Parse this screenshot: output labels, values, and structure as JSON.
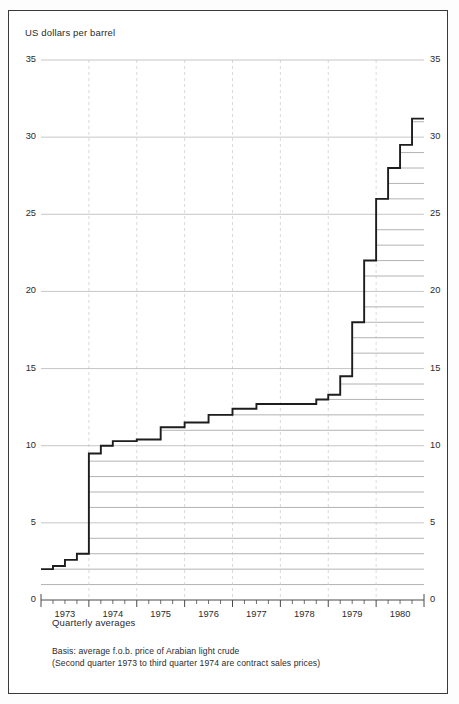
{
  "figure": {
    "axis_title": "US dollars per barrel",
    "sub_label": "Quarterly averages",
    "footnote_line1": "Basis: average f.o.b. price of Arabian light crude",
    "footnote_line2": "(Second quarter 1973 to third quarter 1974 are contract sales prices)"
  },
  "chart_data": {
    "type": "line",
    "subtype": "step",
    "title": "US dollars per barrel",
    "xlabel": "Quarterly averages",
    "ylabel": "US dollars per barrel",
    "ylim": [
      0,
      35
    ],
    "ytick_labels": [
      "0",
      "5",
      "10",
      "15",
      "20",
      "25",
      "30",
      "35"
    ],
    "ytick_values": [
      0,
      5,
      10,
      15,
      20,
      25,
      30,
      35
    ],
    "yticks_both_sides": true,
    "minor_gridline_step": 1,
    "grid": true,
    "legend": "none",
    "xtick_labels": [
      "1973",
      "1974",
      "1975",
      "1976",
      "1977",
      "1978",
      "1979",
      "1980"
    ],
    "xtick_values": [
      1973,
      1974,
      1975,
      1976,
      1977,
      1978,
      1979,
      1980
    ],
    "x_minor_ticks": "quarterly",
    "categories": [
      "1973 Q1",
      "1973 Q2",
      "1973 Q3",
      "1973 Q4",
      "1974 Q1",
      "1974 Q2",
      "1974 Q3",
      "1974 Q4",
      "1975 Q1",
      "1975 Q2",
      "1975 Q3",
      "1975 Q4",
      "1976 Q1",
      "1976 Q2",
      "1976 Q3",
      "1976 Q4",
      "1977 Q1",
      "1977 Q2",
      "1977 Q3",
      "1977 Q4",
      "1978 Q1",
      "1978 Q2",
      "1978 Q3",
      "1978 Q4",
      "1979 Q1",
      "1979 Q2",
      "1979 Q3",
      "1979 Q4",
      "1980 Q1",
      "1980 Q2",
      "1980 Q3",
      "1980 Q4"
    ],
    "values": [
      2.0,
      2.2,
      2.6,
      3.0,
      9.5,
      10.0,
      10.3,
      10.3,
      10.4,
      10.4,
      11.2,
      11.2,
      11.5,
      11.5,
      12.0,
      12.0,
      12.4,
      12.4,
      12.7,
      12.7,
      12.7,
      12.7,
      12.7,
      13.0,
      13.3,
      14.5,
      18.0,
      22.0,
      26.0,
      28.0,
      29.5,
      31.2
    ],
    "units": "US dollars per barrel",
    "annotations": [
      "Basis: average f.o.b. price of Arabian light crude",
      "(Second quarter 1973 to third quarter 1974 are contract sales prices)"
    ],
    "colors": {
      "line": "#1d1d1d",
      "gridline": "#b7b7b7",
      "minor_gridline": "#9a9a9a",
      "frame": "#3a3a3a",
      "text": "#2b2b2b"
    }
  }
}
